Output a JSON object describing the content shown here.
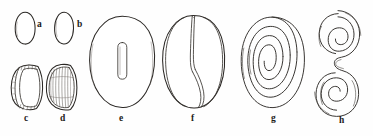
{
  "plate": {
    "background_color": "#fefefe",
    "ink_color": "#2a2724",
    "width": 373,
    "height": 136,
    "figure_count": 8
  },
  "figures": [
    {
      "label": "a",
      "shape_name": "small-vertical-oval",
      "description": "small plain vertical oval outline",
      "label_x": 37,
      "label_y": 25,
      "cx": 25,
      "cy": 28,
      "rx": 10,
      "ry": 16
    },
    {
      "label": "b",
      "shape_name": "small-vertical-oval",
      "description": "small plain vertical oval outline, slightly narrower",
      "label_x": 77,
      "label_y": 25,
      "cx": 64,
      "cy": 28,
      "rx": 9.5,
      "ry": 16
    },
    {
      "label": "c",
      "shape_name": "d-shaped-segmented-valve",
      "description": "D-shaped half oval with hatched marginal band at top and bottom",
      "label_x": 24,
      "label_y": 120,
      "cx": 27,
      "cy": 87,
      "rx": 16,
      "ry": 22
    },
    {
      "label": "d",
      "shape_name": "striated-ribbed-valve",
      "description": "oval valve with fine radial striations across the face",
      "label_x": 60,
      "label_y": 120,
      "cx": 62,
      "cy": 87,
      "rx": 15,
      "ry": 22
    },
    {
      "label": "e",
      "shape_name": "large-oval-with-slit",
      "description": "large rounded oval enclosing a narrow vertical slit aperture",
      "label_x": 119,
      "label_y": 120,
      "cx": 122,
      "cy": 62,
      "rx": 33,
      "ry": 46
    },
    {
      "label": "f",
      "shape_name": "oval-with-internal-s-fold",
      "description": "large oval with an internal S-shaped folded partition",
      "label_x": 191,
      "label_y": 120,
      "cx": 194,
      "cy": 62,
      "rx": 31,
      "ry": 46
    },
    {
      "label": "g",
      "shape_name": "planispiral-coil",
      "description": "large planispiral coil of about two and a half whorls",
      "label_x": 271,
      "label_y": 120,
      "cx": 273,
      "cy": 62,
      "rx": 32,
      "ry": 45
    },
    {
      "label": "h",
      "shape_name": "double-spiral",
      "description": "S-shaped double spiral with an upper and a lower coil",
      "label_x": 339,
      "label_y": 122,
      "cx": 339,
      "cy": 62,
      "rx": 23,
      "ry": 52
    }
  ]
}
